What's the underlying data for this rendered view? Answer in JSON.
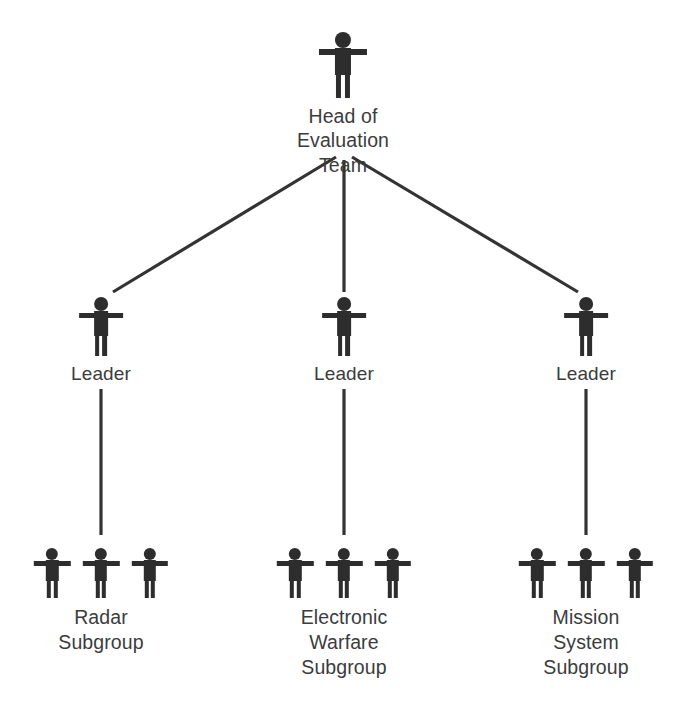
{
  "diagram": {
    "type": "organization-chart",
    "colors": {
      "figure": "#2d2d2d",
      "text": "#3c3c3c",
      "connector": "#333333",
      "background": "#ffffff"
    },
    "root": {
      "id": "head-of-evaluation-team",
      "label": "Head of\nEvaluation\nTeam",
      "figure_count": 1,
      "x": 343,
      "y": 32
    },
    "middle": [
      {
        "id": "leader-radar",
        "label": "Leader",
        "figure_count": 1,
        "x": 101,
        "y": 297
      },
      {
        "id": "leader-electronic-warfare",
        "label": "Leader",
        "figure_count": 1,
        "x": 344,
        "y": 297
      },
      {
        "id": "leader-mission-system",
        "label": "Leader",
        "figure_count": 1,
        "x": 586,
        "y": 297
      }
    ],
    "leaves": [
      {
        "id": "radar-subgroup",
        "label": "Radar\nSubgroup",
        "figure_count": 3,
        "x": 101,
        "y": 548
      },
      {
        "id": "electronic-warfare-subgroup",
        "label": "Electronic\nWarfare\nSubgroup",
        "figure_count": 3,
        "x": 344,
        "y": 548
      },
      {
        "id": "mission-system-subgroup",
        "label": "Mission\nSystem\nSubgroup",
        "figure_count": 3,
        "x": 586,
        "y": 548
      }
    ],
    "connectors": [
      {
        "id": "root-to-leader-left",
        "from": "head-of-evaluation-team",
        "to": "leader-radar",
        "x1": 336,
        "y1": 157,
        "x2": 113,
        "y2": 292
      },
      {
        "id": "root-to-leader-center",
        "from": "head-of-evaluation-team",
        "to": "leader-electronic-warfare",
        "x1": 344,
        "y1": 160,
        "x2": 344,
        "y2": 292
      },
      {
        "id": "root-to-leader-right",
        "from": "head-of-evaluation-team",
        "to": "leader-mission-system",
        "x1": 352,
        "y1": 157,
        "x2": 578,
        "y2": 292
      },
      {
        "id": "leader-left-to-radar",
        "from": "leader-radar",
        "to": "radar-subgroup",
        "x1": 101,
        "y1": 389,
        "x2": 101,
        "y2": 535
      },
      {
        "id": "leader-center-to-electronic",
        "from": "leader-electronic-warfare",
        "to": "electronic-warfare-subgroup",
        "x1": 344,
        "y1": 389,
        "x2": 344,
        "y2": 535
      },
      {
        "id": "leader-right-to-mission",
        "from": "leader-mission-system",
        "to": "mission-system-subgroup",
        "x1": 586,
        "y1": 389,
        "x2": 586,
        "y2": 535
      }
    ]
  }
}
